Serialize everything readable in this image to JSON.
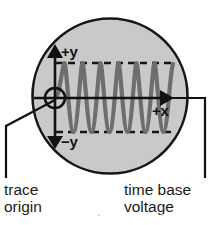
{
  "diagram": {
    "colors": {
      "screen_fill": "#c9c9c9",
      "screen_outline": "#161616",
      "waveform": "#6e6e6e",
      "axis": "#111111",
      "dashed_guide": "#141414",
      "label_text": "#111111",
      "background": "#ffffff"
    },
    "screen": {
      "shape": "circle",
      "center_x": 110,
      "center_y": 96,
      "radius": 78
    },
    "axes": {
      "y_positive_label": "+y",
      "y_negative_label": "−y",
      "x_positive_label": "+x",
      "origin_marker": "small-circle",
      "x_axis_y": 98,
      "y_axis_x": 55
    },
    "guides": {
      "upper_dashed_y": 63,
      "lower_dashed_y": 132,
      "dash_pattern": "7 5"
    },
    "waveform": {
      "type": "sine",
      "cycles": 3.25,
      "amplitude_px": 35,
      "start_x": 55,
      "end_x": 173,
      "stroke_width": 4
    },
    "callouts": [
      {
        "id": "trace-origin",
        "line1": "trace",
        "line2": "origin",
        "anchor_x": 55,
        "anchor_y": 100,
        "elbow_x": 6,
        "elbow_y": 126,
        "end_y": 178
      },
      {
        "id": "time-base-voltage",
        "line1": "time base",
        "line2": "voltage",
        "anchor_x": 171,
        "anchor_y": 98,
        "elbow_x": 205,
        "elbow_y": 98,
        "end_y": 178
      }
    ],
    "ghost_caption": {
      "fragment_a": "fl",
      "fragment_b": "t",
      "fragment_c": "l"
    }
  }
}
